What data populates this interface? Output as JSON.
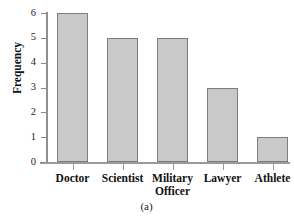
{
  "chart_data": {
    "type": "bar",
    "title": "",
    "subtitle": "",
    "xlabel": "",
    "ylabel": "Frequency",
    "categories": [
      "Doctor",
      "Scientist",
      "Military Officer",
      "Lawyer",
      "Athlete"
    ],
    "category_lines": [
      [
        "Doctor"
      ],
      [
        "Scientist"
      ],
      [
        "Military",
        "Officer"
      ],
      [
        "Lawyer"
      ],
      [
        "Athlete"
      ]
    ],
    "values": [
      6,
      5,
      5,
      3,
      1
    ],
    "ylim": [
      0,
      6
    ],
    "ytick_labels": [
      "0",
      "1",
      "2",
      "3",
      "4",
      "5",
      "6"
    ],
    "ytick_values": [
      0,
      1,
      2,
      3,
      4,
      5,
      6
    ],
    "grid": false,
    "legend": false,
    "legend_position": "none",
    "bar_fill_color": "#c9c9c9",
    "bar_border_color": "#7d7d7d",
    "axis_color": "#9a9a9a"
  },
  "caption": "(a)"
}
